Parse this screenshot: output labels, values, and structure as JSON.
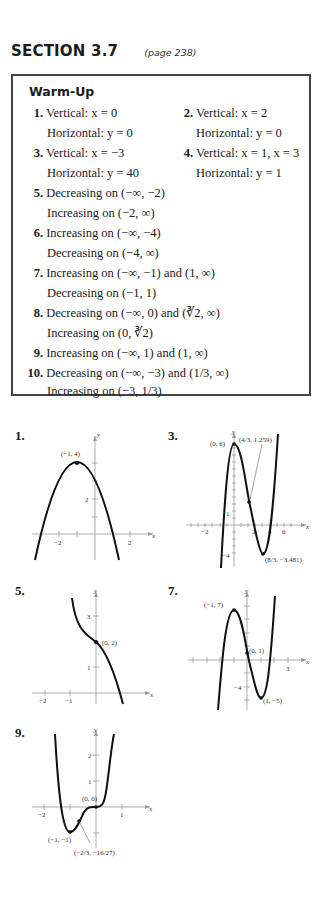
{
  "header": {
    "section": "SECTION 3.7",
    "page": "(page 238)"
  },
  "warmup": {
    "title": "Warm-Up",
    "items": [
      {
        "num": "1.",
        "lines": [
          "Vertical:  x = 0",
          "Horizontal:  y = 0"
        ]
      },
      {
        "num": "2.",
        "lines": [
          "Vertical:  x = 2",
          "Horizontal:  y = 0"
        ]
      },
      {
        "num": "3.",
        "lines": [
          "Vertical:  x = −3",
          "Horizontal:  y = 40"
        ]
      },
      {
        "num": "4.",
        "lines": [
          "Vertical:  x = 1, x = 3",
          "Horizontal:  y = 1"
        ]
      },
      {
        "num": "5.",
        "lines": [
          "Decreasing on (−∞, −2)",
          "Increasing on (−2, ∞)"
        ]
      },
      {
        "num": "6.",
        "lines": [
          "Increasing on (−∞, −4)",
          "Decreasing on (−4, ∞)"
        ]
      },
      {
        "num": "7.",
        "lines": [
          "Increasing on (−∞, −1) and (1, ∞)",
          "Decreasing on (−1, 1)"
        ]
      },
      {
        "num": "8.",
        "lines": [
          "Decreasing on (−∞, 0) and (∛2, ∞)",
          "Increasing on (0, ∛2)"
        ]
      },
      {
        "num": "9.",
        "lines": [
          "Increasing on (−∞, 1) and (1, ∞)"
        ]
      },
      {
        "num": "10.",
        "lines": [
          "Decreasing on (−∞, −3) and (1/3, ∞)",
          "Increasing on (−3, 1/3)"
        ]
      }
    ]
  },
  "graphs": [
    {
      "num": "1.",
      "axis_labels": {
        "x": "x",
        "y": "y"
      },
      "x_ticks": [
        "−2",
        "2"
      ],
      "y_ticks": [
        "2"
      ],
      "points": [
        {
          "label": "(−1, 4)",
          "x": -1,
          "y": 4
        }
      ]
    },
    {
      "num": "3.",
      "axis_labels": {
        "x": "x",
        "y": "y"
      },
      "x_ticks": [
        "−2",
        "2",
        "4",
        "6"
      ],
      "y_ticks": [
        "1",
        "−4"
      ],
      "points": [
        {
          "label": "(0, 6)",
          "x": 0,
          "y": 6
        },
        {
          "label": "(4/3, 1.259)",
          "x": 1.333,
          "y": 1.259
        },
        {
          "label": "(8/3, −3.481)",
          "x": 2.667,
          "y": -3.481
        }
      ]
    },
    {
      "num": "5.",
      "axis_labels": {
        "x": "x",
        "y": "y"
      },
      "x_ticks": [
        "−2",
        "−1"
      ],
      "y_ticks": [
        "3",
        "1"
      ],
      "points": [
        {
          "label": "(0, 2)",
          "x": 0,
          "y": 2
        }
      ]
    },
    {
      "num": "7.",
      "axis_labels": {
        "x": "x",
        "y": "y"
      },
      "x_ticks": [
        "3"
      ],
      "y_ticks": [
        "−4"
      ],
      "points": [
        {
          "label": "(−1, 7)",
          "x": -1,
          "y": 7
        },
        {
          "label": "(0, 1)",
          "x": 0,
          "y": 1
        },
        {
          "label": "(1, −5)",
          "x": 1,
          "y": -5
        }
      ]
    },
    {
      "num": "9.",
      "axis_labels": {
        "x": "x",
        "y": "y"
      },
      "x_ticks": [
        "−2",
        "1"
      ],
      "y_ticks": [
        "2",
        "1"
      ],
      "points": [
        {
          "label": "(0, 0)",
          "x": 0,
          "y": 0
        },
        {
          "label": "(−1, −1)",
          "x": -1,
          "y": -1
        },
        {
          "label": "(−2/3, −16/27)",
          "x": -0.667,
          "y": -0.593
        }
      ]
    }
  ]
}
